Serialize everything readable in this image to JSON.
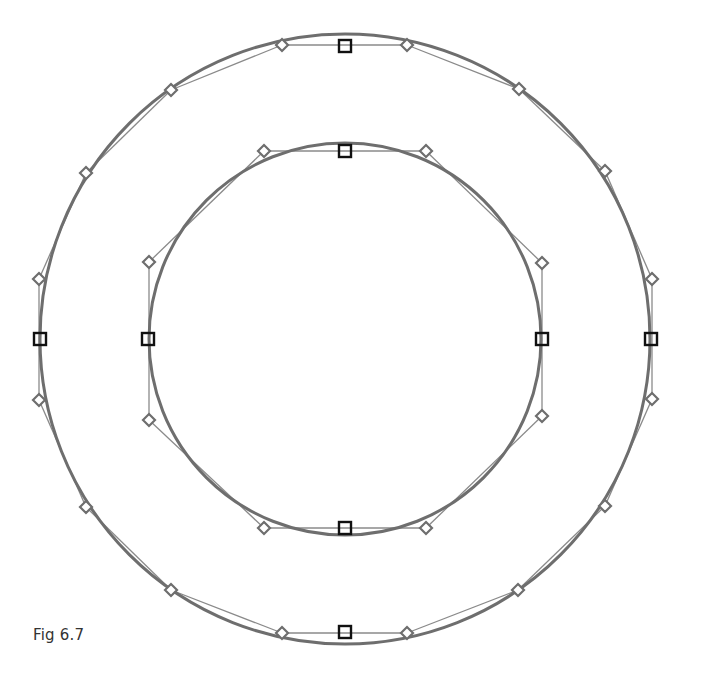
{
  "caption": "Fig 6.7",
  "colors": {
    "curve": "#6e6e6e",
    "handle_line": "#8a8a8a",
    "handle_diamond": "#6e6e6e",
    "anchor_square": "#111111",
    "background": "#ffffff"
  },
  "outer_circle": {
    "center": [
      345,
      339
    ],
    "radius": 305,
    "anchors": [
      [
        345,
        46
      ],
      [
        651,
        339
      ],
      [
        345,
        632
      ],
      [
        40,
        339
      ]
    ],
    "handles": [
      [
        282,
        45
      ],
      [
        407,
        45
      ],
      [
        519,
        89
      ],
      [
        605,
        171
      ],
      [
        652,
        279
      ],
      [
        652,
        399
      ],
      [
        605,
        506
      ],
      [
        518,
        590
      ],
      [
        407,
        633
      ],
      [
        282,
        633
      ],
      [
        171,
        590
      ],
      [
        86,
        507
      ],
      [
        39,
        400
      ],
      [
        39,
        279
      ],
      [
        86,
        173
      ],
      [
        171,
        90
      ]
    ],
    "handle_segments": [
      [
        [
          282,
          45
        ],
        [
          407,
          45
        ]
      ],
      [
        [
          407,
          45
        ],
        [
          519,
          89
        ]
      ],
      [
        [
          519,
          89
        ],
        [
          605,
          171
        ]
      ],
      [
        [
          605,
          171
        ],
        [
          652,
          279
        ]
      ],
      [
        [
          652,
          279
        ],
        [
          652,
          399
        ]
      ],
      [
        [
          652,
          399
        ],
        [
          605,
          506
        ]
      ],
      [
        [
          605,
          506
        ],
        [
          518,
          590
        ]
      ],
      [
        [
          518,
          590
        ],
        [
          407,
          633
        ]
      ],
      [
        [
          407,
          633
        ],
        [
          282,
          633
        ]
      ],
      [
        [
          282,
          633
        ],
        [
          171,
          590
        ]
      ],
      [
        [
          171,
          590
        ],
        [
          86,
          507
        ]
      ],
      [
        [
          86,
          507
        ],
        [
          39,
          400
        ]
      ],
      [
        [
          39,
          400
        ],
        [
          39,
          279
        ]
      ],
      [
        [
          39,
          279
        ],
        [
          86,
          173
        ]
      ],
      [
        [
          86,
          173
        ],
        [
          171,
          90
        ]
      ],
      [
        [
          171,
          90
        ],
        [
          282,
          45
        ]
      ]
    ]
  },
  "inner_circle": {
    "center": [
      345,
      339
    ],
    "radius": 196,
    "anchors": [
      [
        345,
        151
      ],
      [
        542,
        339
      ],
      [
        345,
        528
      ],
      [
        148,
        339
      ]
    ],
    "handles": [
      [
        264,
        151
      ],
      [
        426,
        151
      ],
      [
        542,
        263
      ],
      [
        542,
        416
      ],
      [
        426,
        528
      ],
      [
        264,
        528
      ],
      [
        149,
        420
      ],
      [
        149,
        262
      ]
    ],
    "handle_segments": [
      [
        [
          264,
          151
        ],
        [
          426,
          151
        ]
      ],
      [
        [
          426,
          151
        ],
        [
          542,
          263
        ]
      ],
      [
        [
          542,
          263
        ],
        [
          542,
          416
        ]
      ],
      [
        [
          542,
          416
        ],
        [
          426,
          528
        ]
      ],
      [
        [
          426,
          528
        ],
        [
          264,
          528
        ]
      ],
      [
        [
          264,
          528
        ],
        [
          149,
          420
        ]
      ],
      [
        [
          149,
          420
        ],
        [
          149,
          262
        ]
      ],
      [
        [
          149,
          262
        ],
        [
          264,
          151
        ]
      ]
    ]
  }
}
